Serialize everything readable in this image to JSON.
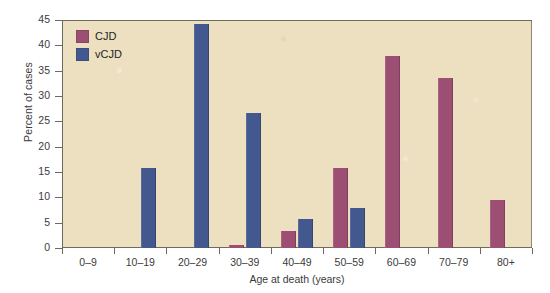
{
  "chart_data": {
    "type": "bar",
    "title": "",
    "xlabel": "Age at death (years)",
    "ylabel": "Percent of cases",
    "categories": [
      "0–9",
      "10–19",
      "20–29",
      "30–39",
      "40–49",
      "50–59",
      "60–69",
      "70–79",
      "80+"
    ],
    "series": [
      {
        "name": "CJD",
        "color": "#9c4f73",
        "values": [
          0,
          0,
          0,
          0.5,
          3.4,
          15.8,
          37.8,
          33.5,
          9.4
        ]
      },
      {
        "name": "vCJD",
        "color": "#42588f",
        "values": [
          0,
          15.8,
          44.2,
          26.6,
          5.7,
          7.9,
          0,
          0,
          0
        ]
      }
    ],
    "ylim": [
      0,
      45
    ],
    "yticks": [
      0,
      5,
      10,
      15,
      20,
      25,
      30,
      35,
      40,
      45
    ],
    "ytick_labels": [
      "0",
      "5",
      "10",
      "15",
      "20",
      "25",
      "30",
      "35",
      "40",
      "45"
    ],
    "grid": false,
    "legend_position": "top-left",
    "plot_background": "#ece0c0",
    "axis_color": "#6e6a5e"
  },
  "legend": {
    "items": [
      {
        "label": "CJD",
        "color": "#9c4f73"
      },
      {
        "label": "vCJD",
        "color": "#42588f"
      }
    ]
  }
}
